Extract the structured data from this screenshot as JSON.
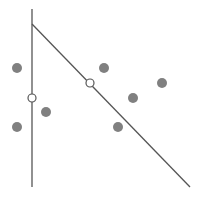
{
  "diagram": {
    "colors": {
      "background": "#ffffff",
      "line": "#555555",
      "point_fill": "#808080",
      "open_point_fill": "#ffffff",
      "open_point_stroke": "#555555"
    },
    "lines": [
      {
        "name": "vertical-line",
        "x1": 32,
        "y1": 9,
        "x2": 32,
        "y2": 187
      },
      {
        "name": "diagonal-line",
        "x1": 32,
        "y1": 24,
        "x2": 190,
        "y2": 187
      }
    ],
    "filled_points": [
      {
        "x": 17,
        "y": 68
      },
      {
        "x": 17,
        "y": 127
      },
      {
        "x": 46,
        "y": 112
      },
      {
        "x": 104,
        "y": 68
      },
      {
        "x": 162,
        "y": 83
      },
      {
        "x": 133,
        "y": 98
      },
      {
        "x": 118,
        "y": 127
      }
    ],
    "open_points": [
      {
        "x": 32,
        "y": 98
      },
      {
        "x": 90,
        "y": 83
      }
    ],
    "point_radius": 5,
    "open_point_radius": 4
  }
}
